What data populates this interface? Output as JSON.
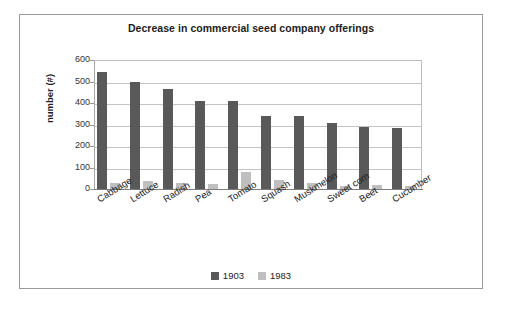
{
  "chart_data": {
    "type": "bar",
    "title": "Decrease in commercial seed company offerings",
    "xlabel": "",
    "ylabel": "number (#)",
    "ylim": [
      0,
      600
    ],
    "ytick_labels": [
      "600",
      "500",
      "400",
      "300",
      "200",
      "100",
      "0"
    ],
    "ytick_values": [
      600,
      500,
      400,
      300,
      200,
      100,
      0
    ],
    "grid": true,
    "legend_position": "bottom",
    "categories": [
      "Cabbage",
      "Lettuce",
      "Radish",
      "Pea",
      "Tomato",
      "Squash",
      "Muskmelon",
      "Sweet corn",
      "Beet",
      "Cucumber"
    ],
    "series": [
      {
        "name": "1903",
        "color": "#595959",
        "values": [
          544,
          497,
          463,
          408,
          408,
          341,
          338,
          307,
          288,
          285
        ]
      },
      {
        "name": "1983",
        "color": "#bfbfbf",
        "values": [
          28,
          36,
          27,
          25,
          79,
          40,
          27,
          12,
          17,
          16
        ]
      }
    ]
  }
}
